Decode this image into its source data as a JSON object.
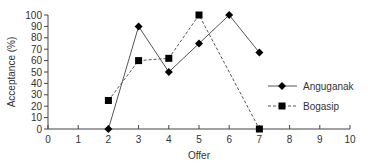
{
  "chart_data": {
    "type": "line",
    "title": "",
    "xlabel": "Offer",
    "ylabel": "Acceptance (%)",
    "xlim": [
      0,
      10
    ],
    "ylim": [
      0,
      100
    ],
    "x_ticks": [
      0,
      1,
      2,
      3,
      4,
      5,
      6,
      7,
      8,
      9,
      10
    ],
    "y_ticks": [
      0,
      10,
      20,
      30,
      40,
      50,
      60,
      70,
      80,
      90,
      100
    ],
    "grid": false,
    "legend_position": "right",
    "series": [
      {
        "name": "Anguganak",
        "marker": "diamond",
        "line": "solid",
        "color": "#000000",
        "points": [
          [
            2,
            0
          ],
          [
            3,
            90
          ],
          [
            4,
            50
          ],
          [
            5,
            75
          ],
          [
            6,
            100
          ],
          [
            7,
            67
          ]
        ]
      },
      {
        "name": "Bogasip",
        "marker": "square",
        "line": "dashed",
        "color": "#000000",
        "points": [
          [
            2,
            25
          ],
          [
            3,
            60
          ],
          [
            4,
            62
          ],
          [
            5,
            100
          ],
          [
            7,
            0
          ]
        ]
      }
    ]
  }
}
